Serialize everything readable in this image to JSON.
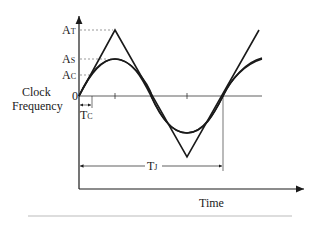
{
  "diagram": {
    "y_axis_title_line1": "Clock",
    "y_axis_title_line2": "Frequency",
    "x_axis_title": "Time",
    "labels": {
      "at_main": "A",
      "at_sub": "T",
      "as_main": "A",
      "as_sub": "S",
      "ac_main": "A",
      "ac_sub": "C",
      "zero": "0",
      "tc_main": "T",
      "tc_sub": "C",
      "tj_main": "T",
      "tj_sub": "J"
    },
    "curves": [
      {
        "name": "triangular modulation",
        "shape": "triangle",
        "peak": "AT"
      },
      {
        "name": "sinusoidal modulation",
        "shape": "sine",
        "peak": "AS"
      }
    ],
    "colors": {
      "line": "#1a1a1a",
      "dashed": "#555555",
      "rule": "#bbbbbb"
    }
  }
}
